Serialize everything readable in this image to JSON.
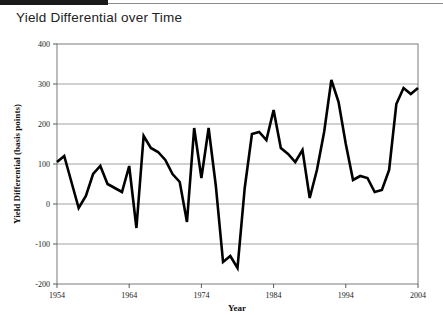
{
  "header": {
    "title": "Yield Differential over Time",
    "bar_color": "#1a1a1a",
    "rule_color": "#8a8a8a"
  },
  "chart_data": {
    "type": "line",
    "title": "Yield Differential over Time",
    "xlabel": "Year",
    "ylabel": "Yield Differential (basis points)",
    "xlim": [
      1954,
      2004
    ],
    "ylim": [
      -200,
      400
    ],
    "ytick_labels": [
      "400",
      "300",
      "200",
      "100",
      "0",
      "-100",
      "-200"
    ],
    "yticks": [
      400,
      300,
      200,
      100,
      0,
      -100,
      -200
    ],
    "xtick_labels": [
      "1954",
      "1964",
      "1974",
      "1984",
      "1994",
      "2004"
    ],
    "xticks": [
      1954,
      1964,
      1974,
      1984,
      1994,
      2004
    ],
    "grid": "horizontal",
    "legend": "none",
    "line_color": "#000000",
    "line_width": 2.6,
    "series": [
      {
        "name": "Yield Differential",
        "x": [
          1954,
          1955,
          1956,
          1957,
          1958,
          1959,
          1960,
          1961,
          1962,
          1963,
          1964,
          1965,
          1966,
          1967,
          1968,
          1969,
          1970,
          1971,
          1972,
          1973,
          1974,
          1975,
          1976,
          1977,
          1978,
          1979,
          1980,
          1981,
          1982,
          1983,
          1984,
          1985,
          1986,
          1987,
          1988,
          1989,
          1990,
          1991,
          1992,
          1993,
          1994,
          1995,
          1996,
          1997,
          1998,
          1999,
          2000,
          2001,
          2002,
          2003,
          2004
        ],
        "values": [
          105,
          120,
          55,
          -10,
          20,
          75,
          95,
          50,
          40,
          30,
          95,
          -60,
          170,
          140,
          130,
          110,
          75,
          55,
          -45,
          190,
          65,
          190,
          45,
          -145,
          -130,
          -160,
          40,
          175,
          180,
          160,
          235,
          140,
          125,
          105,
          135,
          15,
          85,
          180,
          310,
          255,
          150,
          60,
          70,
          65,
          30,
          35,
          85,
          250,
          290,
          275,
          290
        ]
      }
    ]
  }
}
